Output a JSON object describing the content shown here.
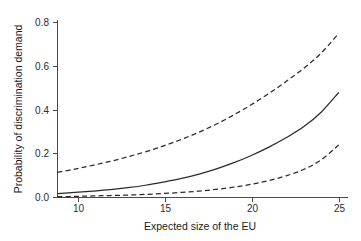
{
  "chart_data": {
    "type": "line",
    "title": "",
    "xlabel": "Expected size of the EU",
    "ylabel": "Probability of discrimination demand",
    "xlim": [
      9,
      25.5
    ],
    "ylim": [
      0.0,
      0.8
    ],
    "xticks": [
      10,
      15,
      20,
      25
    ],
    "xtick_labels": [
      "10",
      "15",
      "20",
      "25"
    ],
    "yticks": [
      0.0,
      0.2,
      0.4,
      0.6,
      0.8
    ],
    "ytick_labels": [
      "0.0",
      "0.2",
      "0.4",
      "0.6",
      "0.8"
    ],
    "grid": false,
    "legend": "none",
    "x": [
      9,
      10,
      11,
      12,
      13,
      14,
      15,
      16,
      17,
      18,
      19,
      20,
      21,
      22,
      23,
      24,
      25
    ],
    "series": [
      {
        "name": "Upper 95% confidence bound",
        "style": "dashed",
        "color": "#2a2a2a",
        "values": [
          0.115,
          0.13,
          0.147,
          0.165,
          0.186,
          0.209,
          0.235,
          0.264,
          0.297,
          0.334,
          0.376,
          0.423,
          0.474,
          0.53,
          0.59,
          0.66,
          0.75
        ]
      },
      {
        "name": "Predicted probability",
        "style": "solid",
        "color": "#2a2a2a",
        "values": [
          0.018,
          0.023,
          0.029,
          0.036,
          0.045,
          0.056,
          0.07,
          0.086,
          0.106,
          0.13,
          0.158,
          0.191,
          0.229,
          0.273,
          0.323,
          0.39,
          0.48
        ]
      },
      {
        "name": "Lower 95% confidence bound",
        "style": "dashed",
        "color": "#2a2a2a",
        "values": [
          0.004,
          0.005,
          0.007,
          0.009,
          0.011,
          0.014,
          0.018,
          0.023,
          0.029,
          0.037,
          0.047,
          0.06,
          0.077,
          0.099,
          0.128,
          0.172,
          0.24
        ]
      }
    ],
    "colors": {
      "line": "#2a2a2a",
      "axis": "#4a4a4a",
      "text": "#1a1a1a",
      "background": "#ffffff"
    }
  }
}
